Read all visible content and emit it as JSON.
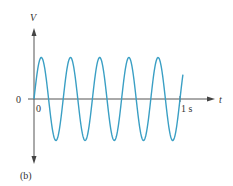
{
  "figure": {
    "panel_label": "(b)",
    "y_axis_label": "V",
    "x_axis_label": "t",
    "origin_y_label": "0",
    "origin_x_label": "0",
    "end_tick_label": "1 s",
    "wave_color": "#3a9fc4",
    "axis_color": "#555555"
  },
  "chart_data": {
    "type": "line",
    "title": "",
    "xlabel": "t",
    "ylabel": "V",
    "frequency_hz": 5,
    "cycles_shown": 5,
    "x_range": [
      0,
      1.02
    ],
    "x_ticks": [
      {
        "value": 0,
        "label": "0"
      },
      {
        "value": 1,
        "label": "1 s"
      }
    ],
    "y_ticks": [
      {
        "value": 0,
        "label": "0"
      }
    ],
    "series": [
      {
        "name": "V(t)",
        "function": "sin(2*pi*5*t)"
      }
    ]
  }
}
